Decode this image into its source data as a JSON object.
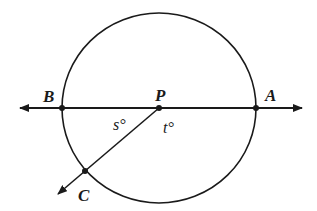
{
  "diagram": {
    "colors": {
      "stroke": "#1a1a1a",
      "background": "#ffffff"
    },
    "points": {
      "P": {
        "label": "P"
      },
      "A": {
        "label": "A"
      },
      "B": {
        "label": "B"
      },
      "C": {
        "label": "C"
      }
    },
    "angles": {
      "s": {
        "label": "s°"
      },
      "t": {
        "label": "t°"
      }
    }
  }
}
